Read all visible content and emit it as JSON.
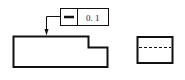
{
  "drawing": {
    "type": "GD&T straightness tolerance illustration",
    "feature_control_frame": {
      "symbol": "straightness",
      "symbol_glyph": "—",
      "tolerance": "0. 1"
    },
    "front_view": {
      "description": "stepped block outline"
    },
    "side_view": {
      "description": "rectangle with dashed hidden line"
    },
    "colors": {
      "line": "#111111",
      "background": "#ffffff"
    }
  }
}
